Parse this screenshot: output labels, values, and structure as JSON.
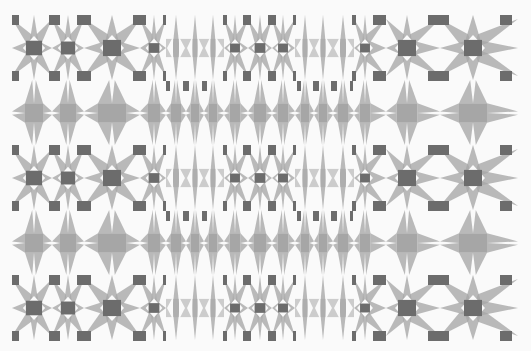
{
  "image": {
    "width": 531,
    "height": 351,
    "description": "Abstract grayscale geometric tile pattern of star and flower motifs"
  },
  "colors": {
    "background": "#fafafa",
    "fill": "#a6a6a6",
    "fill_opacity": 0.78,
    "dark": "#6c6c6c"
  },
  "bounds": {
    "left": 12,
    "right": 518,
    "top": 15,
    "bottom": 340
  },
  "columns": [
    {
      "x": 34,
      "left": 12,
      "right": 52,
      "type": "flower"
    },
    {
      "x": 68,
      "left": 52,
      "right": 84,
      "type": "flower"
    },
    {
      "x": 112,
      "left": 84,
      "right": 140,
      "type": "flower"
    },
    {
      "x": 154,
      "left": 140,
      "right": 166,
      "type": "flower"
    },
    {
      "x": 176,
      "left": 166,
      "right": 186,
      "type": "diamond"
    },
    {
      "x": 195,
      "left": 186,
      "right": 204,
      "type": "diamond"
    },
    {
      "x": 213,
      "left": 204,
      "right": 224,
      "type": "diamond"
    },
    {
      "x": 235,
      "left": 224,
      "right": 248,
      "type": "flower"
    },
    {
      "x": 260,
      "left": 248,
      "right": 272,
      "type": "flower"
    },
    {
      "x": 283,
      "left": 272,
      "right": 295,
      "type": "flower"
    },
    {
      "x": 305,
      "left": 295,
      "right": 314,
      "type": "diamond"
    },
    {
      "x": 323,
      "left": 314,
      "right": 333,
      "type": "diamond"
    },
    {
      "x": 343,
      "left": 333,
      "right": 354,
      "type": "diamond"
    },
    {
      "x": 365,
      "left": 354,
      "right": 386,
      "type": "flower"
    },
    {
      "x": 407,
      "left": 386,
      "right": 440,
      "type": "flower"
    },
    {
      "x": 473,
      "left": 440,
      "right": 518,
      "type": "flower"
    }
  ],
  "rows": [
    {
      "y": 48,
      "top": 15,
      "bottom": 80,
      "type": "A"
    },
    {
      "y": 113,
      "top": 80,
      "bottom": 145,
      "type": "B"
    },
    {
      "y": 178,
      "top": 145,
      "bottom": 210,
      "type": "A"
    },
    {
      "y": 243,
      "top": 210,
      "bottom": 275,
      "type": "B"
    },
    {
      "y": 308,
      "top": 275,
      "bottom": 340,
      "type": "A"
    }
  ],
  "rect_offsets": [
    -28,
    28
  ],
  "rect_height": 10,
  "rects_x": [
    [
      12,
      19
    ],
    [
      49,
      60
    ],
    [
      77,
      91
    ],
    [
      133,
      146
    ],
    [
      163,
      166
    ],
    [
      223,
      227
    ],
    [
      243,
      251
    ],
    [
      268,
      276
    ],
    [
      293,
      296
    ],
    [
      352,
      356
    ],
    [
      373,
      386
    ],
    [
      428,
      449
    ],
    [
      500,
      512
    ]
  ],
  "lower_rects": {
    "offset": 38,
    "height": 10,
    "x": [
      [
        166,
        170
      ],
      [
        183,
        189
      ],
      [
        202,
        207
      ],
      [
        297,
        301
      ],
      [
        313,
        319
      ],
      [
        331,
        337
      ],
      [
        350,
        353
      ]
    ]
  }
}
